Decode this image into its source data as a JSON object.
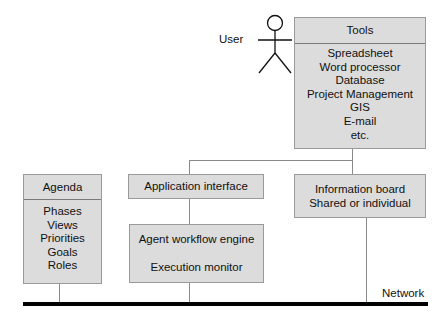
{
  "user": {
    "label": "User"
  },
  "tools": {
    "title": "Tools",
    "items": [
      "Spreadsheet",
      "Word processor",
      "Database",
      "Project Management",
      "GIS",
      "E-mail",
      "etc."
    ]
  },
  "agenda": {
    "title": "Agenda",
    "items": [
      "Phases",
      "Views",
      "Priorities",
      "Goals",
      "Roles"
    ]
  },
  "app_interface": {
    "label": "Application interface"
  },
  "info_board": {
    "line1": "Information board",
    "line2": "Shared or individual"
  },
  "agent_engine": {
    "line1": "Agent workflow engine",
    "line2": "Execution monitor"
  },
  "network": {
    "label": "Network"
  }
}
